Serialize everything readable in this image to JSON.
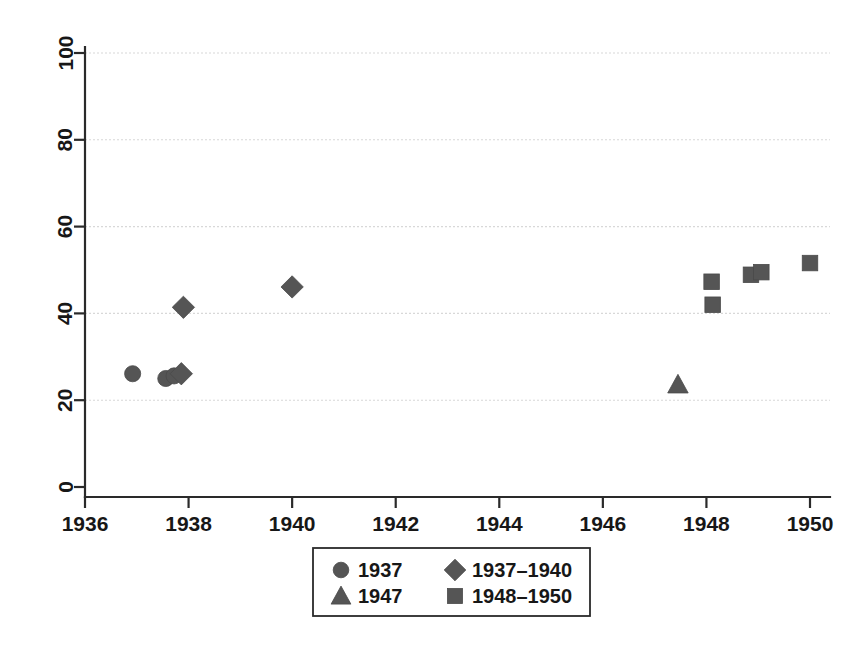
{
  "chart_data": {
    "type": "scatter",
    "title": "",
    "subtitle": "",
    "xlabel": "",
    "ylabel": "",
    "xlim": [
      1935.6,
      1950.6
    ],
    "ylim": [
      0,
      100
    ],
    "grid": true,
    "grid_axis": "y",
    "legend_position": "bottom-center",
    "x_ticks": [
      1936,
      1938,
      1940,
      1942,
      1944,
      1946,
      1948,
      1950
    ],
    "x_tick_labels": [
      "1936",
      "1938",
      "1940",
      "1942",
      "1944",
      "1946",
      "1948",
      "1950"
    ],
    "y_ticks": [
      0,
      20,
      40,
      60,
      80,
      100
    ],
    "y_tick_labels": [
      "0",
      "20",
      "40",
      "60",
      "80",
      "100"
    ],
    "y_tick_rotation": 90,
    "series": [
      {
        "name": "1937",
        "marker": "circle",
        "color": "#555555",
        "points": [
          {
            "x": 1936.92,
            "y": 26.1
          },
          {
            "x": 1937.56,
            "y": 25.0
          },
          {
            "x": 1937.72,
            "y": 25.6
          }
        ]
      },
      {
        "name": "1937–1940",
        "marker": "diamond",
        "color": "#555555",
        "points": [
          {
            "x": 1937.86,
            "y": 26.1
          },
          {
            "x": 1937.9,
            "y": 41.4
          },
          {
            "x": 1940.0,
            "y": 46.1
          }
        ]
      },
      {
        "name": "1947",
        "marker": "triangle",
        "color": "#555555",
        "points": [
          {
            "x": 1947.45,
            "y": 23.6
          }
        ]
      },
      {
        "name": "1948–1950",
        "marker": "square",
        "color": "#555555",
        "points": [
          {
            "x": 1948.1,
            "y": 47.3
          },
          {
            "x": 1948.12,
            "y": 42.0
          },
          {
            "x": 1948.86,
            "y": 48.9
          },
          {
            "x": 1949.06,
            "y": 49.5
          },
          {
            "x": 1950.0,
            "y": 51.6
          }
        ]
      }
    ]
  },
  "legend": {
    "entries": [
      {
        "label": "1937",
        "marker": "circle"
      },
      {
        "label": "1937–1940",
        "marker": "diamond"
      },
      {
        "label": "1947",
        "marker": "triangle"
      },
      {
        "label": "1948–1950",
        "marker": "square"
      }
    ]
  }
}
